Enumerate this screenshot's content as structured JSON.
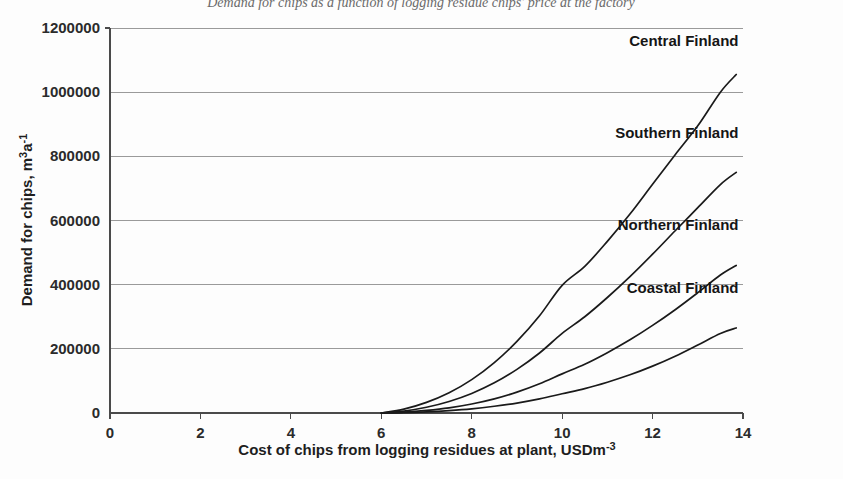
{
  "chart_data": {
    "type": "line",
    "title": "Demand for chips as a function of logging residue chips' price at the factory",
    "xlabel": "Cost of chips from logging residues at plant, USDm-3",
    "ylabel": "Demand for chips, m3a-1",
    "xlim": [
      0,
      14
    ],
    "ylim": [
      0,
      1200000
    ],
    "xticks": [
      0,
      2,
      4,
      6,
      8,
      10,
      12,
      14
    ],
    "yticks": [
      0,
      200000,
      400000,
      600000,
      800000,
      1000000,
      1200000
    ],
    "xtick_labels": [
      "0",
      "2",
      "4",
      "6",
      "8",
      "10",
      "12",
      "14"
    ],
    "ytick_labels": [
      "0",
      "200000",
      "400000",
      "600000",
      "800000",
      "1000000",
      "1200000"
    ],
    "grid": "horizontal",
    "legend_position": "inline-right-of-curve-ends",
    "x": [
      6.0,
      6.5,
      7.0,
      7.5,
      8.0,
      8.5,
      9.0,
      9.5,
      10.0,
      10.5,
      11.0,
      11.5,
      12.0,
      12.5,
      13.0,
      13.5,
      13.85
    ],
    "series": [
      {
        "name": "Central Finland",
        "label": "Central Finland",
        "label_x": 13.9,
        "label_y": 1160000,
        "color": "#1a1a1a",
        "values": [
          0,
          12000,
          33000,
          63000,
          104000,
          157000,
          223000,
          303000,
          398000,
          457000,
          535000,
          620000,
          713000,
          805000,
          895000,
          1000000,
          1055000
        ]
      },
      {
        "name": "Southern Finland",
        "label": "Southern Finland",
        "label_x": 13.9,
        "label_y": 872000,
        "color": "#1a1a1a",
        "values": [
          0,
          6000,
          18000,
          36000,
          61000,
          94000,
          136000,
          187000,
          248000,
          300000,
          360000,
          425000,
          495000,
          568000,
          640000,
          712000,
          750000
        ]
      },
      {
        "name": "Northern Finland",
        "label": "Northern Finland",
        "label_x": 13.9,
        "label_y": 585000,
        "color": "#1a1a1a",
        "values": [
          0,
          2500,
          8000,
          16000,
          28000,
          44000,
          65000,
          91000,
          122000,
          152000,
          188000,
          228000,
          273000,
          322000,
          375000,
          430000,
          460000
        ]
      },
      {
        "name": "Coastal Finland",
        "label": "Coastal Finland",
        "label_x": 13.9,
        "label_y": 390000,
        "color": "#1a1a1a",
        "values": [
          0,
          1000,
          3500,
          7500,
          13000,
          21000,
          31000,
          44000,
          60000,
          76000,
          96000,
          119000,
          146000,
          177000,
          212000,
          248000,
          265000
        ]
      }
    ]
  }
}
